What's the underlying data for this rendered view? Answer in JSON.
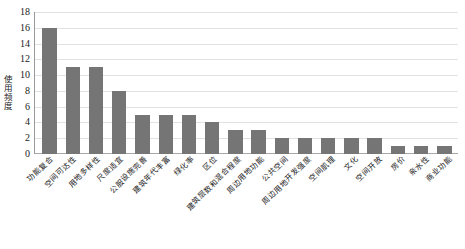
{
  "chart_data": {
    "type": "bar",
    "title": "",
    "xlabel": "",
    "ylabel": "使用频度",
    "ylim": [
      0,
      18
    ],
    "ytick_step": 2,
    "yticks": [
      18,
      16,
      14,
      12,
      10,
      8,
      6,
      4,
      2,
      0
    ],
    "grid": true,
    "legend": false,
    "bar_color": "#757575",
    "gridline_color": "#e2e2e2",
    "axis_color": "#9a9a9a",
    "categories": [
      "功能复合",
      "空间可达性",
      "用地多样性",
      "尺度适宜",
      "公服设施完善",
      "建筑年代丰富",
      "绿化率",
      "区位",
      "建筑层数和混合程度",
      "周边用地功能",
      "公共空间",
      "周边用地开发强度",
      "空间肌理",
      "文化",
      "空间开放",
      "房价",
      "亲水性",
      "商业功能"
    ],
    "values": [
      16,
      11,
      11,
      8,
      5,
      5,
      5,
      4,
      3,
      3,
      2,
      2,
      2,
      2,
      2,
      1,
      1,
      1
    ]
  }
}
